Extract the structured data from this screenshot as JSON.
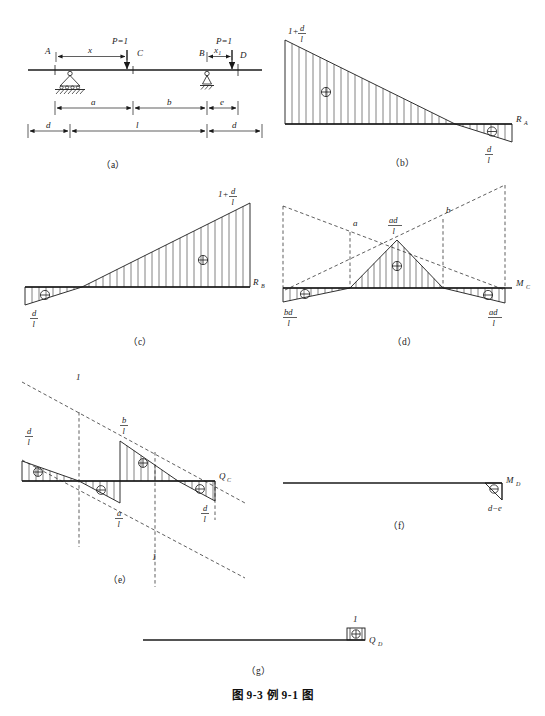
{
  "figure": {
    "caption": "图 9-3   例 9-1 图",
    "panels": [
      {
        "id": "a",
        "letter": "（a）",
        "title": "beam-layout"
      },
      {
        "id": "b",
        "letter": "（b）",
        "title": "influence-line-RA"
      },
      {
        "id": "c",
        "letter": "（c）",
        "title": "influence-line-RB"
      },
      {
        "id": "d",
        "letter": "（d）",
        "title": "influence-line-MC"
      },
      {
        "id": "e",
        "letter": "（e）",
        "title": "influence-line-QC"
      },
      {
        "id": "f",
        "letter": "（f）",
        "title": "influence-line-MD"
      },
      {
        "id": "g",
        "letter": "（g）",
        "title": "influence-line-QD"
      }
    ]
  },
  "panel_a": {
    "points": {
      "A": "A",
      "B": "B",
      "C": "C",
      "D": "D"
    },
    "loads": [
      {
        "name": "load-left",
        "label": "P=1",
        "offset_label": "x"
      },
      {
        "name": "load-right",
        "label": "P=1",
        "offset_label": "x₁"
      }
    ],
    "dimensions_upper": [
      "a",
      "b",
      "e"
    ],
    "dimensions_lower": [
      "d",
      "l",
      "d"
    ]
  },
  "panel_b": {
    "ordinate_left": "1+",
    "ordinate_left_num": "d",
    "ordinate_left_den": "l",
    "ordinate_right_num": "d",
    "ordinate_right_den": "l",
    "sign_positive": "⊕",
    "sign_negative": "⊖",
    "axis_label": "R",
    "axis_sub": "A"
  },
  "panel_c": {
    "ordinate_right": "1+",
    "ordinate_right_num": "d",
    "ordinate_right_den": "l",
    "ordinate_left_num": "d",
    "ordinate_left_den": "l",
    "sign_positive": "⊕",
    "sign_negative": "⊖",
    "axis_label": "R",
    "axis_sub": "B"
  },
  "panel_d": {
    "apex_num": "ad",
    "apex_den": "l",
    "left_num": "bd",
    "left_den": "l",
    "right_num": "ad",
    "right_den": "l",
    "dashed_label_left": "a",
    "dashed_label_right": "b",
    "sign_positive": "⊕",
    "sign_negative": "⊖",
    "axis_label": "M",
    "axis_sub": "C"
  },
  "panel_e": {
    "top_left_num": "d",
    "top_left_den": "l",
    "mid_top_num": "b",
    "mid_top_den": "l",
    "mid_bottom_num": "a",
    "mid_bottom_den": "l",
    "right_num": "d",
    "right_den": "l",
    "unit_label_upper": "1",
    "unit_label_lower": "1",
    "sign_positive": "⊕",
    "sign_negative": "⊖",
    "axis_label": "Q",
    "axis_sub": "C"
  },
  "panel_f": {
    "value_label": "d−e",
    "sign_negative": "⊖",
    "axis_label": "M",
    "axis_sub": "D"
  },
  "panel_g": {
    "value_label": "1",
    "sign_positive": "⊕",
    "axis_label": "Q",
    "axis_sub": "D"
  },
  "colors": {
    "ink": "#1a1a1a",
    "background": "#ffffff"
  }
}
